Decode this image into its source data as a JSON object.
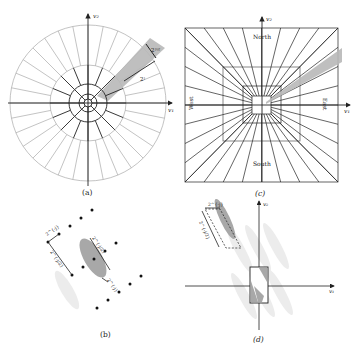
{
  "panels": {
    "a": {
      "caption": "(a)",
      "axis_x": "v₁",
      "axis_y": "v₂",
      "annotation_outer": "2ʲᵄ²",
      "annotation_outer_text": "2^{j/2}",
      "annotation_radius": "2ʲ",
      "annotation_radius_text": "2^j"
    },
    "b": {
      "caption": "(b)",
      "annotation_short": "2^{-j}",
      "annotation_long": "2^{-j/2}",
      "annotation_ellipse_long": "2^{-j/2}",
      "annotation_ellipse_short": "2^{-j}"
    },
    "c": {
      "caption": "(c)",
      "axis_x": "v₁",
      "axis_y": "v₂",
      "north": "North",
      "south": "South",
      "west": "West",
      "east": "East"
    },
    "d": {
      "caption": "(d)",
      "axis_x": "v₁",
      "axis_y": "v₂",
      "annotation_short": "2^{-j}",
      "annotation_long": "2^{-j/2}"
    }
  },
  "colors": {
    "line_dark": "#222222",
    "line_light": "#9a9a9a",
    "wedge_fill": "#b8b8b8",
    "ellipse_fill": "#a8a8a8",
    "ghost_fill": "#ececec"
  }
}
